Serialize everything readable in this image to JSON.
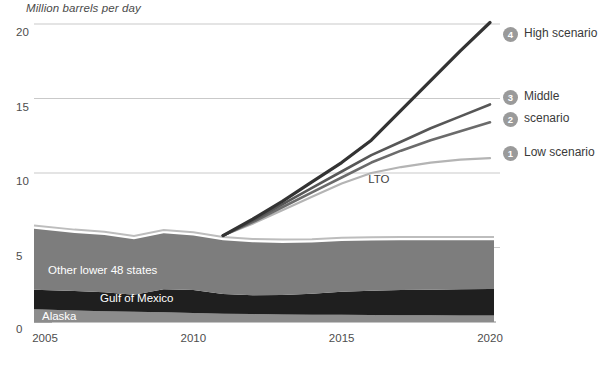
{
  "chart_data": {
    "type": "area",
    "title": "Million barrels per day",
    "xlabel": "",
    "ylabel": "Million barrels per day",
    "xlim": [
      2005,
      2021
    ],
    "ylim": [
      0,
      21.5
    ],
    "grid": true,
    "legend_position": "right",
    "x_ticks": [
      "2005",
      "2010",
      "2015",
      "2020"
    ],
    "x_tick_values": [
      2005,
      2010,
      2015,
      2020
    ],
    "y_ticks": [
      "0",
      "5",
      "10",
      "15",
      "20"
    ],
    "y_tick_values": [
      0,
      5,
      10,
      15,
      20
    ],
    "x": [
      2005,
      2006,
      2007,
      2008,
      2009,
      2010,
      2011,
      2012,
      2013,
      2014,
      2015,
      2016,
      2017,
      2018,
      2019,
      2020
    ],
    "stacked_series": [
      {
        "name": "Alaska",
        "color": "#8c8c8c",
        "values": [
          0.86,
          0.78,
          0.72,
          0.68,
          0.65,
          0.6,
          0.56,
          0.53,
          0.51,
          0.49,
          0.48,
          0.47,
          0.46,
          0.45,
          0.44,
          0.43
        ]
      },
      {
        "name": "Gulf of Mexico",
        "color": "#1f1f1f",
        "values": [
          1.3,
          1.3,
          1.27,
          1.15,
          1.55,
          1.55,
          1.32,
          1.27,
          1.3,
          1.4,
          1.55,
          1.62,
          1.68,
          1.72,
          1.75,
          1.78
        ]
      },
      {
        "name": "Other lower 48 states",
        "color": "#7d7d7d",
        "values": [
          4.1,
          3.9,
          3.85,
          3.72,
          3.75,
          3.65,
          3.6,
          3.55,
          3.5,
          3.45,
          3.4,
          3.38,
          3.35,
          3.32,
          3.3,
          3.28
        ]
      }
    ],
    "scenario_series": [
      {
        "id": 1,
        "name": "Low scenario",
        "color": "#b4b4b4",
        "width": 2.2,
        "values": [
          null,
          null,
          null,
          null,
          null,
          null,
          5.8,
          6.6,
          7.5,
          8.4,
          9.3,
          10.0,
          10.4,
          10.7,
          10.9,
          11.0
        ]
      },
      {
        "id": 2,
        "name": "scenario",
        "color": "#6b6b6b",
        "width": 2.6,
        "values": [
          null,
          null,
          null,
          null,
          null,
          null,
          5.8,
          6.7,
          7.7,
          8.7,
          9.7,
          10.7,
          11.5,
          12.2,
          12.8,
          13.4
        ]
      },
      {
        "id": 3,
        "name": "Middle",
        "color": "#575757",
        "width": 2.6,
        "values": [
          null,
          null,
          null,
          null,
          null,
          null,
          5.8,
          6.8,
          7.9,
          9.0,
          10.1,
          11.2,
          12.1,
          13.0,
          13.8,
          14.6
        ]
      },
      {
        "id": 4,
        "name": "High scenario",
        "color": "#333333",
        "width": 3.2,
        "values": [
          null,
          null,
          null,
          null,
          null,
          null,
          5.8,
          6.9,
          8.1,
          9.4,
          10.7,
          12.2,
          14.2,
          16.2,
          18.2,
          20.1
        ]
      }
    ],
    "annotations": [
      {
        "text": "LTO",
        "x": 2016.3,
        "y": 9.5
      }
    ],
    "area_labels": [
      {
        "text": "Other lower 48 states",
        "x_px": 48,
        "y_px": 264
      },
      {
        "text": "Gulf of Mexico",
        "x_px": 100,
        "y_px": 292
      },
      {
        "text": "Alaska",
        "x_px": 42,
        "y_px": 310
      }
    ],
    "legend": [
      {
        "number": "4",
        "label": "High scenario",
        "y_px": 33,
        "marker_color": "#9a9a9a"
      },
      {
        "number": "3",
        "label": "Middle",
        "y_px": 96,
        "marker_color": "#9a9a9a"
      },
      {
        "number": "2",
        "label": "scenario",
        "y_px": 118,
        "marker_color": "#9a9a9a"
      },
      {
        "number": "1",
        "label": "Low scenario",
        "y_px": 152,
        "marker_color": "#9a9a9a"
      }
    ],
    "colors": {
      "background": "#ffffff",
      "gridline": "#c9c9c9",
      "axis_text": "#4d4d4d",
      "alaska": "#8c8c8c",
      "gulf_of_mexico": "#1f1f1f",
      "other_lower_48": "#7d7d7d",
      "total_outline": "#bdbdbd",
      "low_scenario": "#b4b4b4",
      "scenario_2": "#6b6b6b",
      "middle_scenario": "#575757",
      "high_scenario": "#333333",
      "legend_marker": "#9a9a9a"
    }
  }
}
